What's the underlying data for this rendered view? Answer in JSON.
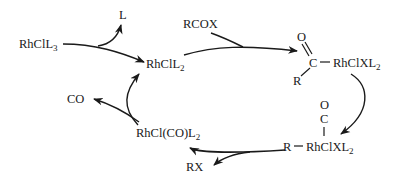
{
  "diagram": {
    "type": "catalytic-cycle",
    "species": {
      "start": {
        "main": "RhClL",
        "sub": "3"
      },
      "catalyst": {
        "main": "RhClL",
        "sub": "2"
      },
      "acyl_complex": {
        "o": "O",
        "c": "C",
        "r": "R",
        "rest": "RhClXL",
        "sub": "2"
      },
      "alkyl_carbonyl": {
        "o": "O",
        "c": "C",
        "r": "R",
        "rest": "RhClXL",
        "sub": "2"
      },
      "carbonyl_complex": {
        "main": "RhCl(CO)L",
        "sub": "2"
      }
    },
    "reagents": {
      "ligand_out": "L",
      "acyl_halide_in": "RCOX",
      "co_out": "CO",
      "product_out": "RX"
    },
    "colors": {
      "ink": "#1a1a1a",
      "background": "#ffffff"
    }
  }
}
